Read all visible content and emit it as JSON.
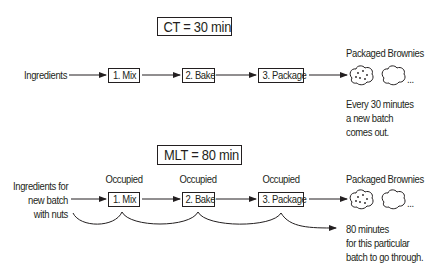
{
  "top": {
    "title": "CT = 30 min",
    "input_label": "Ingredients",
    "steps": [
      {
        "label": "1. Mix"
      },
      {
        "label": "2. Bake"
      },
      {
        "label": "3. Package"
      }
    ],
    "output_label": "Packaged Brownies",
    "output_ellipsis": "...",
    "note_lines": [
      "Every 30 minutes",
      "a new batch",
      "comes out."
    ]
  },
  "bottom": {
    "title": "MLT = 80 min",
    "input_lines": [
      "Ingredients for",
      "new batch",
      "with nuts"
    ],
    "steps": [
      {
        "label": "1. Mix",
        "status": "Occupied"
      },
      {
        "label": "2. Bake",
        "status": "Occupied"
      },
      {
        "label": "3. Package",
        "status": "Occupied"
      }
    ],
    "output_label": "Packaged Brownies",
    "output_ellipsis": "...",
    "note_lines": [
      "80 minutes",
      "for this particular",
      "batch to go through."
    ]
  }
}
